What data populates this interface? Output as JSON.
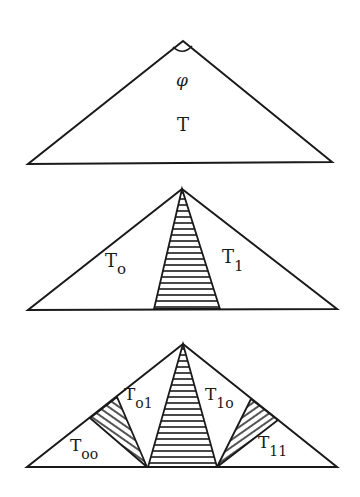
{
  "figure": {
    "panel1": {
      "angle_label": "φ",
      "triangle_label": "T"
    },
    "panel2": {
      "left_label": "T",
      "left_sub": "o",
      "right_label": "T",
      "right_sub": "1"
    },
    "panel3": {
      "labels": [
        {
          "main": "T",
          "sub": "oo"
        },
        {
          "main": "T",
          "sub": "o1"
        },
        {
          "main": "T",
          "sub": "1o"
        },
        {
          "main": "T",
          "sub": "11"
        }
      ]
    },
    "colors": {
      "ink": "#1a1a1a",
      "background": "#ffffff"
    }
  }
}
